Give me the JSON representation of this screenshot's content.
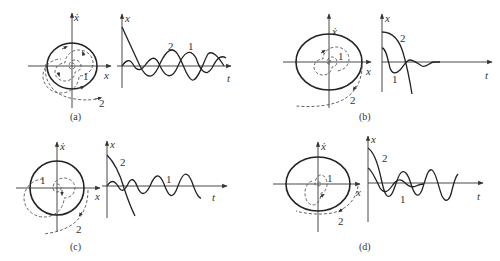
{
  "figure": {
    "panels": [
      {
        "id": "a",
        "caption": "(a)",
        "phase_plot": {
          "x_axis_label": "x",
          "y_axis_label": "ẋ",
          "limit_cycle": "stable",
          "trajectory_labels": [
            "1",
            "2"
          ]
        },
        "time_plot": {
          "x_axis_label": "t",
          "y_axis_label": "x",
          "curve_labels": [
            "2",
            "1"
          ]
        }
      },
      {
        "id": "b",
        "caption": "(b)",
        "phase_plot": {
          "x_axis_label": "x",
          "y_axis_label": "ẋ",
          "limit_cycle": "unstable",
          "trajectory_labels": [
            "1",
            "2"
          ]
        },
        "time_plot": {
          "x_axis_label": "t",
          "y_axis_label": "x",
          "curve_labels": [
            "2",
            "1"
          ]
        }
      },
      {
        "id": "c",
        "caption": "(c)",
        "phase_plot": {
          "x_axis_label": "x",
          "y_axis_label": "ẋ",
          "limit_cycle": "semi-stable (inner stable, outer unstable)",
          "trajectory_labels": [
            "1",
            "2"
          ]
        },
        "time_plot": {
          "x_axis_label": "t",
          "y_axis_label": "x",
          "curve_labels": [
            "2",
            "1"
          ]
        }
      },
      {
        "id": "d",
        "caption": "(d)",
        "phase_plot": {
          "x_axis_label": "x",
          "y_axis_label": "ẋ",
          "limit_cycle": "semi-stable (inner unstable, outer stable)",
          "trajectory_labels": [
            "1",
            "2"
          ]
        },
        "time_plot": {
          "x_axis_label": "t",
          "y_axis_label": "x",
          "curve_labels": [
            "2",
            "1"
          ]
        }
      }
    ]
  }
}
